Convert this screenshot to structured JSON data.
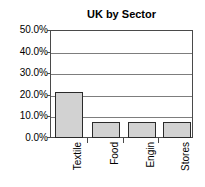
{
  "chart_data": {
    "type": "bar",
    "title": "UK by Sector",
    "xlabel": "",
    "ylabel": "",
    "categories": [
      "Textile",
      "Food",
      "Engin",
      "Stores"
    ],
    "values": [
      21.5,
      7.3,
      7.3,
      7.3
    ],
    "value_labels": [
      "21.5%",
      "7.3%",
      "7.3%",
      "7.3%"
    ],
    "ylim": [
      0,
      50
    ],
    "ytick_labels": [
      "0.0%",
      "10.0%",
      "20.0%",
      "30.0%",
      "40.0%",
      "50.0%"
    ],
    "ytick_values": [
      0,
      10,
      20,
      30,
      40,
      50
    ],
    "grid": true,
    "legend": false,
    "legend_position": "none",
    "bar_fill_color": "#d2d2d2",
    "bar_border_color": "#2b2b2b",
    "gridline_color": "#7d7d7d",
    "frame_color": "#4a4a4a",
    "background_color": "#ffffff",
    "xlabel_rotation": 90
  }
}
